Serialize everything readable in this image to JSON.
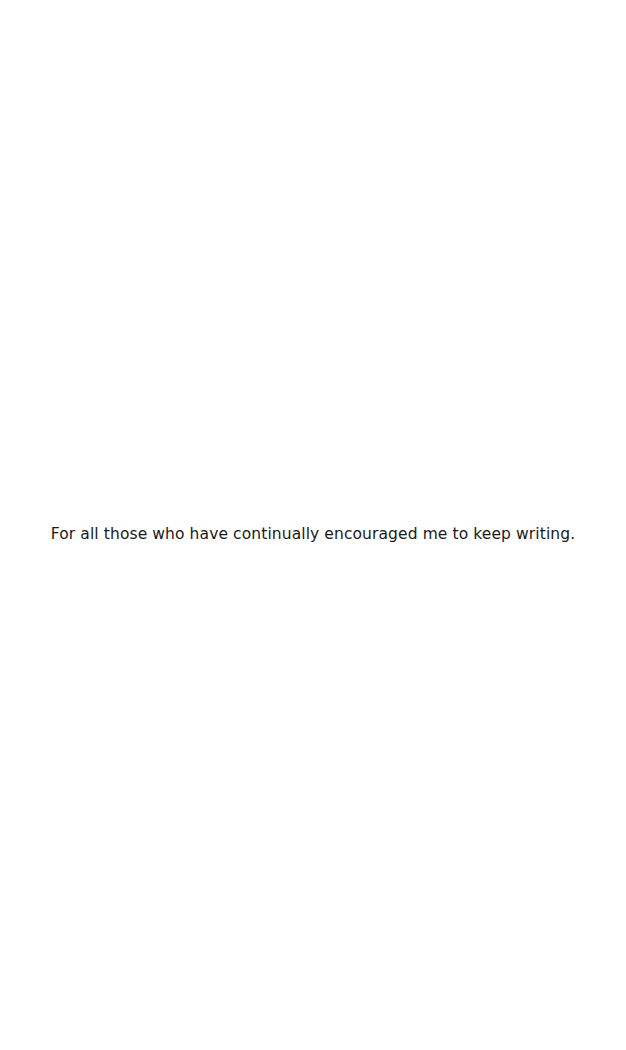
{
  "page": {
    "dedication": "For all those who have continually encouraged me to keep writing."
  }
}
